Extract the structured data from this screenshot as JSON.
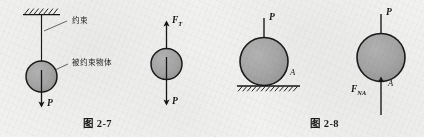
{
  "figure_page": {
    "background_color": "#f2f2f1",
    "ink_color": "#1a1a1a",
    "body_fill_color": "#a9a9a9"
  },
  "figures": [
    {
      "id": "fig-2-7",
      "caption": "图 2-7",
      "panels": [
        {
          "id": "panel-constraint",
          "role": "constrained-body-with-support",
          "annotations": [
            {
              "name": "constraint-label",
              "text": "约束"
            },
            {
              "name": "constrained-body-label",
              "text": "被约束物体"
            }
          ],
          "forces": [
            {
              "name": "weight-force",
              "symbol": "P",
              "direction": "down"
            }
          ],
          "support": "fixed-hatched-ceiling",
          "body_shape": "circle"
        },
        {
          "id": "panel-free-body-2-7",
          "role": "free-body-diagram",
          "forces": [
            {
              "name": "tension-force",
              "symbol": "F",
              "subscript": "T",
              "direction": "up"
            },
            {
              "name": "weight-force",
              "symbol": "P",
              "direction": "down"
            }
          ],
          "body_shape": "circle"
        }
      ]
    },
    {
      "id": "fig-2-8",
      "caption": "图 2-8",
      "panels": [
        {
          "id": "panel-ball-on-ground",
          "role": "body-resting-on-surface",
          "annotations": [
            {
              "name": "contact-point-label",
              "text": "A"
            }
          ],
          "forces": [
            {
              "name": "applied-force",
              "symbol": "P",
              "direction": "down"
            }
          ],
          "support": "hatched-ground",
          "body_shape": "circle"
        },
        {
          "id": "panel-free-body-2-8",
          "role": "free-body-diagram",
          "annotations": [
            {
              "name": "contact-point-label",
              "text": "A"
            }
          ],
          "forces": [
            {
              "name": "applied-force",
              "symbol": "P",
              "direction": "down"
            },
            {
              "name": "normal-reaction-force",
              "symbol": "F",
              "subscript": "NA",
              "direction": "up"
            }
          ],
          "body_shape": "circle"
        }
      ]
    }
  ]
}
